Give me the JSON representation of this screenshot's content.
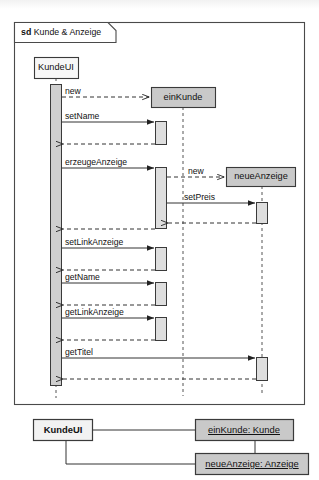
{
  "diagram": {
    "kind": "uml-sequence-diagram",
    "frame": {
      "keyword": "sd",
      "name": "Kunde & Anzeige",
      "label": "sd Kunde & Anzeige"
    },
    "lifelines": [
      {
        "id": "kundeui",
        "label": "KundeUI",
        "x": 56,
        "style": "white"
      },
      {
        "id": "einkunde",
        "label": "einKunde",
        "x": 183,
        "style": "gray"
      },
      {
        "id": "neueanzeige",
        "label": "neueAnzeige",
        "x": 262,
        "style": "gray"
      }
    ],
    "messages": [
      {
        "seq": 1,
        "label": "new",
        "from": "kundeui",
        "to": "einkunde",
        "type": "create",
        "line": "dashed"
      },
      {
        "seq": 2,
        "label": "setName",
        "from": "kundeui",
        "to": "einkunde",
        "type": "call",
        "line": "solid"
      },
      {
        "seq": 3,
        "label": "",
        "from": "einkunde",
        "to": "kundeui",
        "type": "return",
        "line": "dashed"
      },
      {
        "seq": 4,
        "label": "erzeugeAnzeige",
        "from": "kundeui",
        "to": "einkunde",
        "type": "call",
        "line": "solid"
      },
      {
        "seq": 5,
        "label": "new",
        "from": "einkunde",
        "to": "neueanzeige",
        "type": "create",
        "line": "dashed"
      },
      {
        "seq": 6,
        "label": "setPreis",
        "from": "einkunde",
        "to": "neueanzeige",
        "type": "call",
        "line": "solid"
      },
      {
        "seq": 7,
        "label": "",
        "from": "neueanzeige",
        "to": "einkunde",
        "type": "return",
        "line": "dashed"
      },
      {
        "seq": 8,
        "label": "",
        "from": "einkunde",
        "to": "kundeui",
        "type": "return",
        "line": "dashed"
      },
      {
        "seq": 9,
        "label": "setLinkAnzeige",
        "from": "kundeui",
        "to": "einkunde",
        "type": "call",
        "line": "solid"
      },
      {
        "seq": 10,
        "label": "",
        "from": "einkunde",
        "to": "kundeui",
        "type": "return",
        "line": "dashed"
      },
      {
        "seq": 11,
        "label": "getName",
        "from": "kundeui",
        "to": "einkunde",
        "type": "call",
        "line": "solid"
      },
      {
        "seq": 12,
        "label": "",
        "from": "einkunde",
        "to": "kundeui",
        "type": "return",
        "line": "dashed"
      },
      {
        "seq": 13,
        "label": "getLinkAnzeige",
        "from": "kundeui",
        "to": "einkunde",
        "type": "call",
        "line": "solid"
      },
      {
        "seq": 14,
        "label": "",
        "from": "einkunde",
        "to": "kundeui",
        "type": "return",
        "line": "dashed"
      },
      {
        "seq": 15,
        "label": "getTitel",
        "from": "kundeui",
        "to": "neueanzeige",
        "type": "call",
        "line": "solid"
      },
      {
        "seq": 16,
        "label": "",
        "from": "neueanzeige",
        "to": "kundeui",
        "type": "return",
        "line": "dashed"
      }
    ],
    "message_labels": {
      "m1_new": "new",
      "m2_setname": "setName",
      "m3_erzeugeanzeige": "erzeugeAnzeige",
      "m4_new2": "new",
      "m5_setpreis": "setPreis",
      "m6_setlinkanzeige": "setLinkAnzeige",
      "m7_getname": "getName",
      "m8_getlinkanzeige": "getLinkAnzeige",
      "m9_gettitel": "getTitel"
    },
    "lifeline_labels": {
      "kundeui": "KundeUI",
      "einkunde": "einKunde",
      "neueanzeige": "neueAnzeige"
    }
  },
  "object_diagram": {
    "kind": "uml-object-diagram",
    "nodes": [
      {
        "id": "kundeui_obj",
        "label": "KundeUI",
        "bold": true,
        "underline": false,
        "fill": "white"
      },
      {
        "id": "einkunde_obj",
        "label": "einKunde: Kunde",
        "bold": false,
        "underline": true,
        "fill": "gray"
      },
      {
        "id": "neueanzeige_obj",
        "label": "neueAnzeige: Anzeige",
        "bold": false,
        "underline": true,
        "fill": "gray"
      }
    ],
    "links": [
      {
        "from": "kundeui_obj",
        "to": "einkunde_obj"
      },
      {
        "from": "kundeui_obj",
        "to": "neueanzeige_obj"
      }
    ],
    "node_labels": {
      "kundeui": "KundeUI",
      "einkunde": "einKunde: Kunde",
      "neueanzeige": "neueAnzeige: Anzeige"
    }
  },
  "colors": {
    "stroke": "#333333",
    "frame_stroke": "#4a4a4a",
    "gray_fill": "#c9c9c9",
    "activation_fill": "#d0d0d0",
    "light_activation_fill": "#dedede",
    "white_fill": "#f7f7f7",
    "background": "#ffffff"
  }
}
